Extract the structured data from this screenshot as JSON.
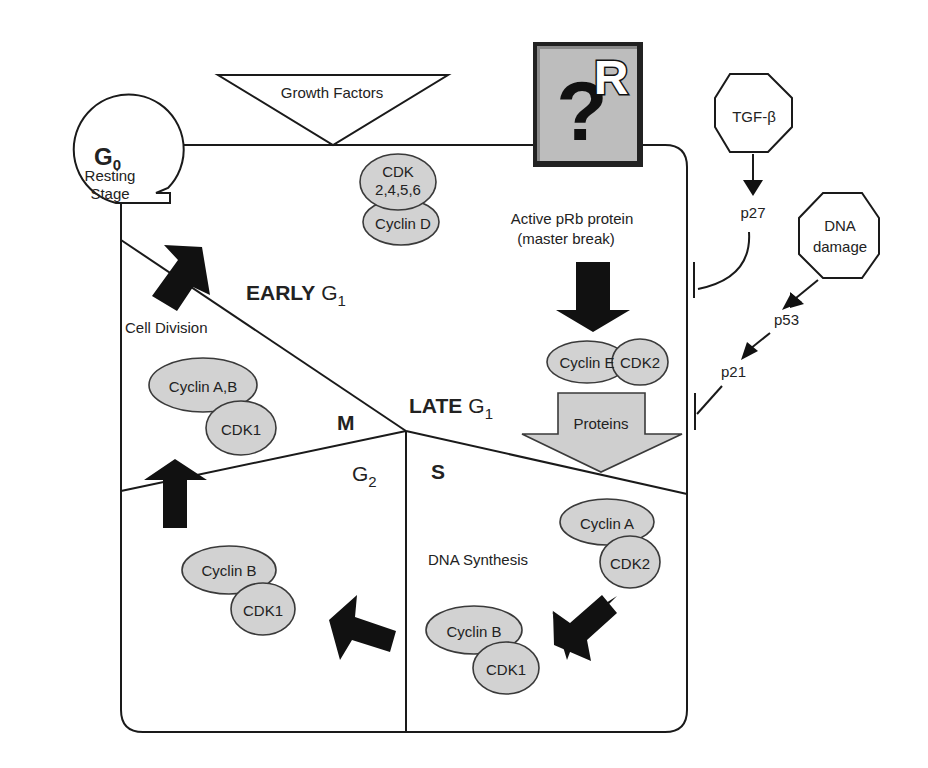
{
  "diagram": {
    "colors": {
      "line": "#1a1a1a",
      "complex_fill": "#d2d2d2",
      "proteins_arrow_fill": "#cfcfcf",
      "restriction_box_fill": "#b8b8b8",
      "black_arrow": "#111111",
      "background": "#ffffff"
    },
    "g0": {
      "symbol": "G",
      "subscript": "0",
      "line1": "Resting",
      "line2": "Stage"
    },
    "growth_factors": {
      "label": "Growth Factors"
    },
    "restriction_point": {
      "symbol": "?",
      "letter": "R",
      "icon": "question-r-icon"
    },
    "tgf_beta": {
      "label": "TGF-β"
    },
    "dna_damage": {
      "line1": "DNA",
      "line2": "damage"
    },
    "inhibitors": {
      "p27": "p27",
      "p53": "p53",
      "p21": "p21"
    },
    "phases": {
      "early_g1": {
        "word": "EARLY",
        "symbol": "G",
        "subscript": "1"
      },
      "late_g1": {
        "word": "LATE",
        "symbol": "G",
        "subscript": "1"
      },
      "m": {
        "label": "M"
      },
      "g2": {
        "symbol": "G",
        "subscript": "2"
      },
      "s": {
        "label": "S"
      }
    },
    "labels": {
      "cell_division": "Cell Division",
      "active_prb_line1": "Active pRb protein",
      "active_prb_line2": "(master break)",
      "proteins": "Proteins",
      "dna_synthesis": "DNA Synthesis"
    },
    "complexes": {
      "cdk_cyclin_d": {
        "cdk_line1": "CDK",
        "cdk_line2": "2,4,5,6",
        "cyclin": "Cyclin D"
      },
      "cyclin_e_cdk2": {
        "cyclin": "Cyclin E",
        "cdk": "CDK2"
      },
      "cyclin_ab_cdk1": {
        "cyclin": "Cyclin A,B",
        "cdk": "CDK1"
      },
      "cyclin_a_cdk2": {
        "cyclin": "Cyclin A",
        "cdk": "CDK2"
      },
      "cyclin_b_cdk1_s": {
        "cyclin": "Cyclin B",
        "cdk": "CDK1"
      },
      "cyclin_b_cdk1_g2": {
        "cyclin": "Cyclin B",
        "cdk": "CDK1"
      }
    }
  }
}
